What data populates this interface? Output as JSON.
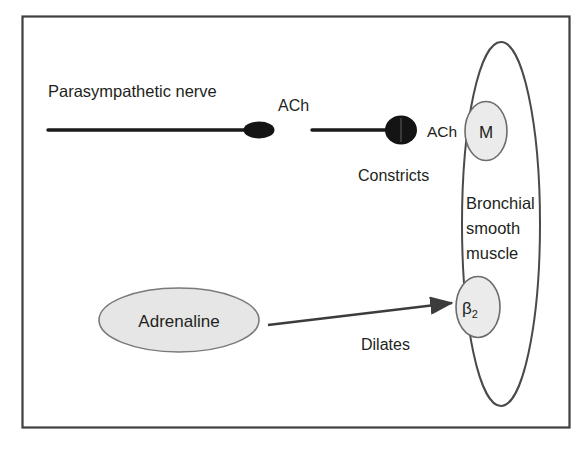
{
  "figure": {
    "frame": {
      "stroke_color": "#3f3f3f"
    },
    "background_color": "#ffffff"
  },
  "labels": {
    "parasympathetic_nerve": "Parasympathetic nerve",
    "ach_upper": "ACh",
    "ach_synapse": "ACh",
    "constricts": "Constricts",
    "bronchial_line1": "Bronchial",
    "bronchial_line2": "smooth",
    "bronchial_line3": "muscle",
    "adrenaline": "Adrenaline",
    "dilates": "Dilates",
    "receptor_m": "M",
    "receptor_b2_base": "β",
    "receptor_b2_sub": "2"
  },
  "colors": {
    "text": "#231f20",
    "nerve_stroke": "#1a1a1a",
    "nerve_terminal_fill": "#141414",
    "receptor_fill": "#ebebeb",
    "receptor_stroke": "#6b6b6b",
    "cell_stroke": "#4a4a4a",
    "adrenaline_fill": "#e6e6e6",
    "adrenaline_stroke": "#7a7a7a",
    "arrow_stroke": "#3c3c3c",
    "frame_stroke": "#3f3f3f"
  },
  "elements": {
    "frame": {
      "x": 22,
      "y": 16,
      "width": 548,
      "height": 412
    },
    "nerve_segment_1": {
      "x1": 48,
      "y1": 130,
      "x2": 252,
      "y2": 130
    },
    "nerve_terminal_1": {
      "cx": 259,
      "cy": 130,
      "rx": 15,
      "ry": 8
    },
    "nerve_segment_2": {
      "x1": 312,
      "y1": 130,
      "x2": 392,
      "y2": 130
    },
    "nerve_terminal_2": {
      "cx": 401,
      "cy": 130,
      "rx": 16,
      "ry": 14
    },
    "receptor_m": {
      "cx": 486,
      "cy": 131,
      "rx": 21,
      "ry": 29
    },
    "receptor_b2": {
      "cx": 478,
      "cy": 307,
      "rx": 22,
      "ry": 30
    },
    "cell_outline": {
      "cx": 501,
      "cy": 224,
      "rx": 39,
      "ry": 182
    },
    "adrenaline_ellipse": {
      "cx": 179,
      "cy": 320,
      "rx": 80,
      "ry": 32
    },
    "arrow": {
      "x1": 268,
      "y1": 325,
      "x2": 455,
      "y2": 303
    }
  }
}
